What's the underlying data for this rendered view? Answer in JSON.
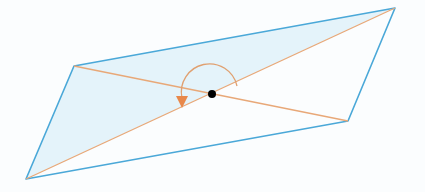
{
  "diagram": {
    "title": "",
    "type": "parallelogram-diagonals",
    "colors": {
      "background": "#fbfdfe",
      "edge": "#4aa8d8",
      "diagonal": "#e8a878",
      "shaded_fill": "#e4f3fa",
      "arc": "#e0a070",
      "arrow_head": "#e8884a",
      "center_point": "#000000"
    },
    "vertices": {
      "top_left": [
        74,
        66
      ],
      "top_right": [
        395,
        8
      ],
      "bottom_right": [
        348,
        121
      ],
      "bottom_left": [
        26,
        179
      ]
    },
    "center": [
      212,
      94
    ],
    "shaded_region": "triangle top_left–top_right–bottom_left",
    "rotation_arc": {
      "description": "curved arrow about center, indicating 180° rotation",
      "start": [
        237,
        86
      ],
      "end": [
        183,
        105
      ]
    }
  }
}
